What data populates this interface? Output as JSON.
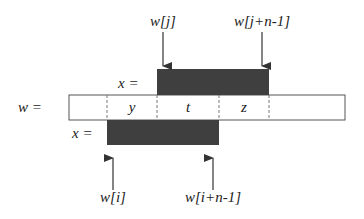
{
  "diagram": {
    "w_label": "w =",
    "x_upper_label": "x =",
    "x_lower_label": "x =",
    "segments": [
      {
        "label": "y"
      },
      {
        "label": "t"
      },
      {
        "label": "z"
      }
    ],
    "arrows": {
      "upper_left": "w[j]",
      "upper_right": "w[j+n-1]",
      "lower_left": "w[i]",
      "lower_right": "w[i+n-1]"
    },
    "colors": {
      "dark_fill": "#3f3f3f",
      "line": "#555555",
      "background": "#ffffff"
    }
  }
}
